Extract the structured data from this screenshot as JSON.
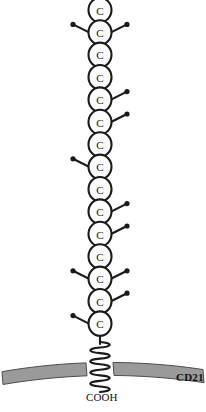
{
  "figure": {
    "protein_label": "CD21",
    "c_terminus_label": "COOH",
    "domain_letter": "C",
    "domain_count": 15,
    "colors": {
      "membrane_fill": "#9a9a9a",
      "membrane_stroke": "#4d4d4d",
      "domain_fill": "#fbfbfb",
      "domain_stroke": "#1a1a1a",
      "branch_color": "#1a1a1a",
      "background": "#ffffff",
      "text": "#111111"
    },
    "geometry": {
      "width": 206,
      "height": 412,
      "chain_center_x": 100,
      "chain_top_y": 2,
      "domain_height": 22.4,
      "domain_rx": 11.5,
      "domain_ry": 12.2,
      "helix_top_y": 342,
      "helix_bottom_y": 392,
      "membrane_left_y": 372,
      "membrane_mid_y": 360,
      "membrane_right_y": 370,
      "membrane_thickness": 13
    },
    "domains": [
      {
        "index": 1,
        "label": "C",
        "branches": []
      },
      {
        "index": 2,
        "label": "C",
        "branches": [
          "right",
          "left"
        ]
      },
      {
        "index": 3,
        "label": "C",
        "branches": []
      },
      {
        "index": 4,
        "label": "C",
        "branches": []
      },
      {
        "index": 5,
        "label": "C",
        "branches": [
          "right"
        ]
      },
      {
        "index": 6,
        "label": "C",
        "branches": [
          "right"
        ]
      },
      {
        "index": 7,
        "label": "C",
        "branches": []
      },
      {
        "index": 8,
        "label": "C",
        "branches": [
          "left"
        ]
      },
      {
        "index": 9,
        "label": "C",
        "branches": []
      },
      {
        "index": 10,
        "label": "C",
        "branches": [
          "right"
        ]
      },
      {
        "index": 11,
        "label": "C",
        "branches": [
          "right"
        ]
      },
      {
        "index": 12,
        "label": "C",
        "branches": []
      },
      {
        "index": 13,
        "label": "C",
        "branches": [
          "right",
          "left"
        ]
      },
      {
        "index": 14,
        "label": "C",
        "branches": [
          "right"
        ]
      },
      {
        "index": 15,
        "label": "C",
        "branches": [
          "left"
        ]
      }
    ]
  }
}
